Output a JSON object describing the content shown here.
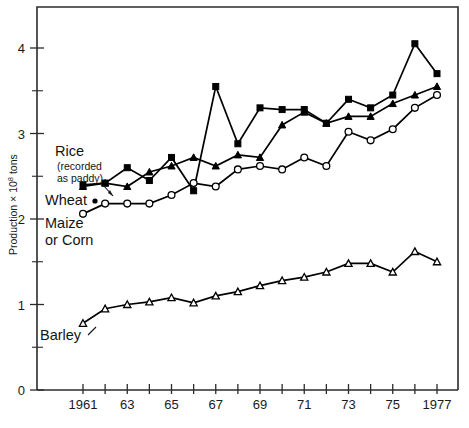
{
  "chart_data": {
    "type": "line",
    "title": "",
    "xlabel": "",
    "ylabel": "Production x 10⁸ tons",
    "ylabel_parts": {
      "pre": "Production  × 10",
      "sup": "8",
      "post": " tons"
    },
    "xlim": [
      1960,
      1978
    ],
    "ylim": [
      0,
      4.6
    ],
    "grid": false,
    "legend_position": "inline-annotations",
    "x": [
      1961,
      1962,
      1963,
      1964,
      1965,
      1966,
      1967,
      1968,
      1969,
      1970,
      1971,
      1972,
      1973,
      1974,
      1975,
      1976,
      1977
    ],
    "x_tick_labels": [
      "1961",
      "",
      "63",
      "",
      "65",
      "",
      "67",
      "",
      "69",
      "",
      "71",
      "",
      "73",
      "",
      "75",
      "",
      "1977"
    ],
    "y_tick_labels": [
      "0",
      "1",
      "2",
      "3",
      "4"
    ],
    "y_ticks_major": [
      0,
      1,
      2,
      3,
      4
    ],
    "y_ticks_minor": [
      0.5,
      1.5,
      2.5,
      3.5
    ],
    "series": [
      {
        "name": "Rice (recorded as paddy)",
        "label": "Rice",
        "sublabel_line1": "(recorded",
        "sublabel_line2": "as paddy)",
        "marker": "filled-square",
        "values": [
          2.4,
          2.42,
          2.6,
          2.45,
          2.72,
          2.33,
          3.55,
          2.88,
          3.3,
          3.28,
          3.28,
          3.12,
          3.4,
          3.3,
          3.45,
          4.05,
          3.7
        ]
      },
      {
        "name": "Wheat",
        "label": "Wheat",
        "marker": "filled-triangle",
        "values": [
          2.38,
          2.42,
          2.38,
          2.55,
          2.62,
          2.72,
          2.62,
          2.75,
          2.72,
          3.1,
          3.25,
          3.12,
          3.2,
          3.2,
          3.35,
          3.45,
          3.55
        ]
      },
      {
        "name": "Maize or Corn",
        "label_line1": "Maize",
        "label_line2": "or Corn",
        "marker": "open-circle",
        "values": [
          2.06,
          2.18,
          2.18,
          2.18,
          2.28,
          2.42,
          2.38,
          2.58,
          2.62,
          2.58,
          2.72,
          2.62,
          3.02,
          2.92,
          3.05,
          3.3,
          3.45
        ]
      },
      {
        "name": "Barley",
        "label": "Barley",
        "marker": "open-triangle",
        "values": [
          0.78,
          0.95,
          1.0,
          1.03,
          1.08,
          1.02,
          1.1,
          1.15,
          1.22,
          1.28,
          1.32,
          1.38,
          1.48,
          1.48,
          1.38,
          1.62,
          1.5
        ]
      }
    ]
  }
}
